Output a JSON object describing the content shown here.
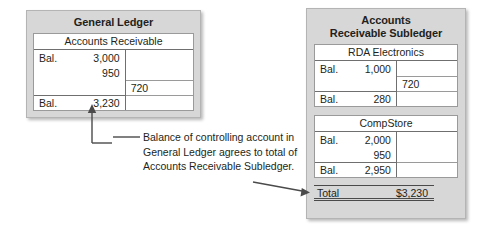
{
  "general_ledger": {
    "title": "General Ledger",
    "account": {
      "name": "Accounts Receivable",
      "rows": [
        {
          "label": "Bal.",
          "debit": "3,000",
          "credit": ""
        },
        {
          "label": "",
          "debit": "950",
          "credit": ""
        },
        {
          "label": "",
          "debit": "",
          "credit": "720"
        },
        {
          "label": "Bal.",
          "debit": "3,230",
          "credit": ""
        }
      ]
    }
  },
  "subledger": {
    "title_line1": "Accounts",
    "title_line2": "Receivable Subledger",
    "accounts": [
      {
        "name": "RDA Electronics",
        "rows": [
          {
            "label": "Bal.",
            "debit": "1,000",
            "credit": ""
          },
          {
            "label": "",
            "debit": "",
            "credit": "720"
          },
          {
            "label": "Bal.",
            "debit": "280",
            "credit": ""
          }
        ]
      },
      {
        "name": "CompStore",
        "rows": [
          {
            "label": "Bal.",
            "debit": "2,000",
            "credit": ""
          },
          {
            "label": "",
            "debit": "950",
            "credit": ""
          },
          {
            "label": "Bal.",
            "debit": "2,950",
            "credit": ""
          }
        ]
      }
    ],
    "total": {
      "label": "Total",
      "amount": "$3,230"
    }
  },
  "annotation": {
    "text": "Balance of controlling account in General Ledger agrees to total of Accounts Receivable Subledger."
  },
  "colors": {
    "panel_fill": "#d7d7d7",
    "panel_border": "#b4b4b4",
    "rule": "#6f6f6f",
    "text": "#231f20",
    "connector": "#4a4a4a"
  }
}
